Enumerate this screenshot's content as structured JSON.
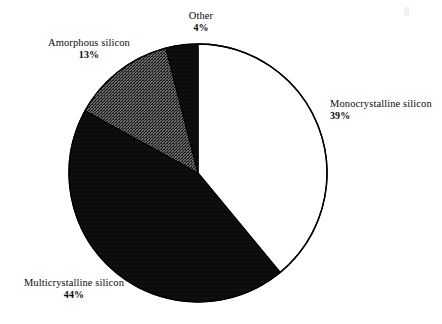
{
  "chart_data": {
    "type": "pie",
    "title": "",
    "subtitle": "",
    "xlabel": "",
    "ylabel": "",
    "legend_position": "none",
    "grid": false,
    "units": "%",
    "start_angle_deg": 0,
    "direction": "clockwise",
    "total": 100,
    "categories": [
      "Monocrystalline silicon",
      "Multicrystalline silicon",
      "Amorphous silicon",
      "Other"
    ],
    "values": [
      39,
      44,
      13,
      4
    ],
    "slices": [
      {
        "label": "Monocrystalline silicon",
        "value": 39,
        "value_text": "39%",
        "fill": "#ffffff",
        "fill_style": "solid-white",
        "stroke": "#000000",
        "start_deg": 0,
        "end_deg": 140.4
      },
      {
        "label": "Multicrystalline silicon",
        "value": 44,
        "value_text": "44%",
        "fill": "#0b0b0b",
        "fill_style": "solid-black",
        "stroke": "#000000",
        "start_deg": 140.4,
        "end_deg": 298.8
      },
      {
        "label": "Amorphous silicon",
        "value": 13,
        "value_text": "13%",
        "fill": "#4a4a4a",
        "fill_style": "dithered-gray",
        "stroke": "#000000",
        "start_deg": 298.8,
        "end_deg": 345.6
      },
      {
        "label": "Other",
        "value": 4,
        "value_text": "4%",
        "fill": "#0b0b0b",
        "fill_style": "solid-black",
        "stroke": "#000000",
        "start_deg": 345.6,
        "end_deg": 360
      }
    ]
  },
  "labels": {
    "other": {
      "name": "Other",
      "percent": "4%"
    },
    "amorphous": {
      "name": "Amorphous silicon",
      "percent": "13%"
    },
    "mono": {
      "name": "Monocrystalline silicon",
      "percent": "39%"
    },
    "multi": {
      "name": "Multicrystalline silicon",
      "percent": "44%"
    }
  },
  "geometry": {
    "center_x": 198,
    "center_y": 173,
    "radius": 129
  },
  "colors": {
    "background": "#ffffff",
    "outline": "#000000",
    "black_slice": "#0b0b0b",
    "gray_slice": "#4a4a4a",
    "white_slice": "#ffffff",
    "text": "#0a0a0a"
  }
}
